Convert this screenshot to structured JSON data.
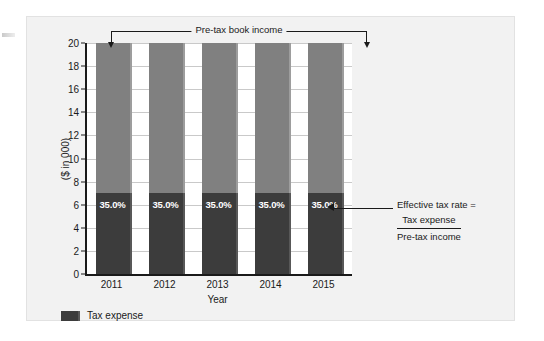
{
  "chart_data": {
    "type": "bar",
    "title": "",
    "subtitle": "",
    "xlabel": "Year",
    "ylabel": "($ in 000)",
    "categories": [
      "2011",
      "2012",
      "2013",
      "2014",
      "2015"
    ],
    "ylim": [
      0,
      20
    ],
    "y_ticks": [
      0,
      2,
      4,
      6,
      8,
      10,
      12,
      14,
      16,
      18,
      20
    ],
    "y_tick_labels": [
      "0",
      "2",
      "4",
      "6",
      "8",
      "10",
      "12",
      "14",
      "16",
      "18",
      "20"
    ],
    "grid": true,
    "stacked": true,
    "legend_position": "bottom-left",
    "series": [
      {
        "name": "Tax expense",
        "color": "#3c3c3c",
        "values": [
          7,
          7,
          7,
          7,
          7
        ],
        "data_labels": [
          "35.0%",
          "35.0%",
          "35.0%",
          "35.0%",
          "35.0%"
        ]
      },
      {
        "name": "Pre-tax book income remainder",
        "color": "#808080",
        "values": [
          13,
          13,
          13,
          13,
          13
        ],
        "data_labels": [
          "",
          "",
          "",
          "",
          ""
        ]
      }
    ],
    "totals": [
      20,
      20,
      20,
      20,
      20
    ],
    "annotations": [
      {
        "id": "pretax-book-income",
        "text": "Pre-tax book income",
        "style": "bracket-with-arrows",
        "points_to": [
          "2011",
          "2015"
        ],
        "position": "top"
      },
      {
        "id": "effective-tax-rate",
        "line1": "Effective tax rate =",
        "numerator": "Tax expense",
        "denominator": "Pre-tax income",
        "style": "leader-arrow-fraction",
        "points_to": "2015-tax-expense-label",
        "position": "right"
      }
    ]
  },
  "legend": {
    "items": [
      {
        "label": "Tax expense",
        "color": "#3c3c3c"
      }
    ]
  },
  "axes": {
    "y_title": "($ in 000)",
    "x_title": "Year"
  },
  "annotation_pretax": {
    "label": "Pre-tax book income"
  },
  "annotation_etr": {
    "line1": "Effective tax rate =",
    "numerator": "Tax expense",
    "denominator": "Pre-tax income"
  },
  "colors": {
    "panel_background": "#f2f2f2",
    "plot_background": "#ffffff",
    "tax_expense": "#3c3c3c",
    "pretax_remainder": "#808080",
    "axis": "#1a1a1a",
    "grid": "#c9c9c9",
    "value_label_text": "#ffffff"
  }
}
